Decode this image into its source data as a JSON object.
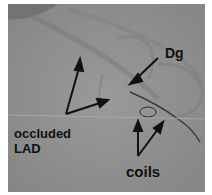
{
  "image": {
    "type": "coronary angiogram (X-ray fluoroscopy)",
    "background_color": "#8f8f8f"
  },
  "annotations": {
    "dg": "Dg",
    "occluded_lad_line1": "occluded",
    "occluded_lad_line2": "LAD",
    "coils": "coils"
  }
}
